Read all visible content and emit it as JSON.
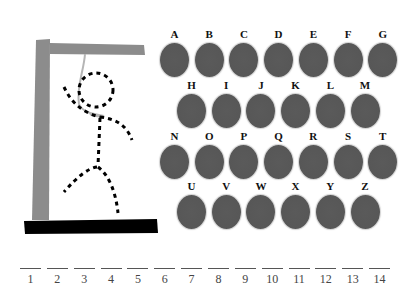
{
  "game": {
    "title": "Hangman",
    "colors": {
      "post": "#8c8c8c",
      "base": "#000000",
      "rope": "#b5b5b5",
      "figure": "#000000",
      "letter_button": "#575757",
      "letter_label": "#111111",
      "slot_line": "#555555",
      "slot_number": "#444444"
    }
  },
  "keyboard": {
    "rows": [
      [
        "A",
        "B",
        "C",
        "D",
        "E",
        "F",
        "G"
      ],
      [
        "H",
        "I",
        "J",
        "K",
        "L",
        "M"
      ],
      [
        "N",
        "O",
        "P",
        "Q",
        "R",
        "S",
        "T"
      ],
      [
        "U",
        "V",
        "W",
        "X",
        "Y",
        "Z"
      ]
    ]
  },
  "word": {
    "length": 14,
    "slots": [
      "1",
      "2",
      "3",
      "4",
      "5",
      "6",
      "7",
      "8",
      "9",
      "10",
      "11",
      "12",
      "13",
      "14"
    ]
  }
}
